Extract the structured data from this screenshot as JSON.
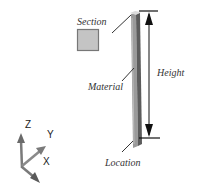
{
  "diagram": {
    "labels": {
      "section": "Section",
      "material": "Material",
      "height": "Height",
      "location": "Location"
    },
    "axes": {
      "z": "Z",
      "y": "Y",
      "x": "X"
    },
    "colors": {
      "column_front": "#8c8c8c",
      "column_side": "#5a5a5a",
      "column_top": "#d8d8d8",
      "section_fill": "#c4c4c4",
      "section_border": "#777777",
      "leader_line": "#333333",
      "dimension_line": "#111111",
      "axis_arrow": "#7a7a7a"
    }
  }
}
